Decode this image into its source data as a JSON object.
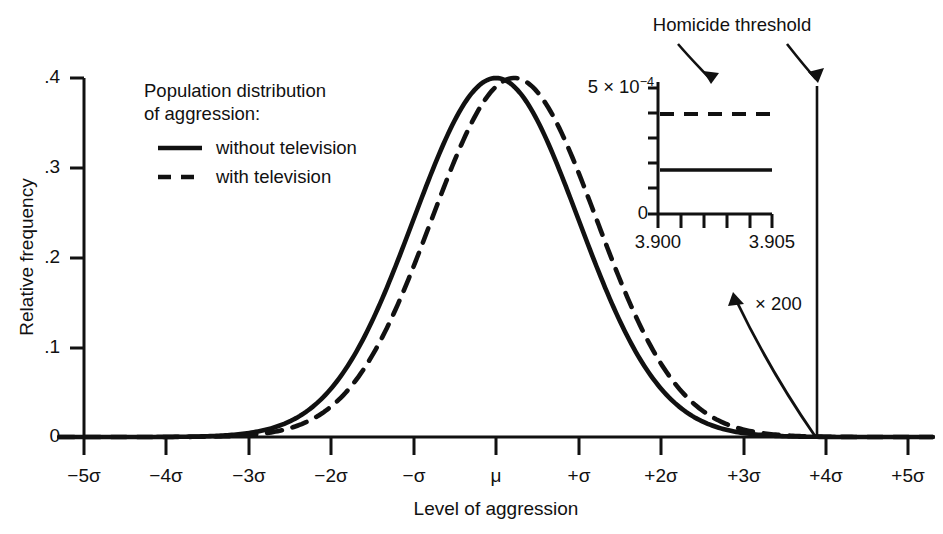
{
  "figure": {
    "background_color": "#ffffff",
    "ink_color": "#111111"
  },
  "axes": {
    "y_title": "Relative frequency",
    "x_title": "Level of aggression",
    "y_ticklabels": [
      ".4",
      ".3",
      ".2",
      ".1",
      "0"
    ],
    "x_ticklabels": [
      "−5σ",
      "−4σ",
      "−3σ",
      "−2σ",
      "−σ",
      "μ",
      "+σ",
      "+2σ",
      "+3σ",
      "+4σ",
      "+5σ"
    ]
  },
  "legend": {
    "title_line1": "Population distribution",
    "title_line2": "of aggression:",
    "items": [
      {
        "label": "without television",
        "style": "solid"
      },
      {
        "label": "with television",
        "style": "dashed"
      }
    ]
  },
  "annotations": {
    "threshold_label": "Homicide threshold",
    "magnification_label": "× 200"
  },
  "inset": {
    "y_top_label_mantissa": "5 × 10",
    "y_top_label_exponent": "−4",
    "y_bottom_label": "0",
    "x_labels": [
      "3.900",
      "3.905"
    ],
    "series": [
      {
        "label": "without television",
        "style": "solid",
        "value": 2.0
      },
      {
        "label": "with television",
        "style": "dashed",
        "value": 4.0
      }
    ]
  },
  "chart_data": {
    "type": "line",
    "title": "",
    "xlabel": "Level of aggression",
    "ylabel": "Relative frequency",
    "xlim": [
      -5,
      5
    ],
    "ylim": [
      0,
      0.4
    ],
    "x_unit": "sigma",
    "x_ticks": [
      -5,
      -4,
      -3,
      -2,
      -1,
      0,
      1,
      2,
      3,
      4,
      5
    ],
    "x_ticklabels": [
      "−5σ",
      "−4σ",
      "−3σ",
      "−2σ",
      "−σ",
      "μ",
      "+σ",
      "+2σ",
      "+3σ",
      "+4σ",
      "+5σ"
    ],
    "y_ticks": [
      0,
      0.1,
      0.2,
      0.3,
      0.4
    ],
    "y_ticklabels": [
      "0",
      ".1",
      ".2",
      ".3",
      ".4"
    ],
    "grid": false,
    "legend_position": "upper-left-inside",
    "series": [
      {
        "name": "without television",
        "style": "solid",
        "distribution": "normal",
        "mean": 0.0,
        "sd": 1.0,
        "peak_value": 0.4,
        "x": [
          -5,
          -4.5,
          -4,
          -3.5,
          -3,
          -2.5,
          -2,
          -1.5,
          -1,
          -0.5,
          0,
          0.5,
          1,
          1.5,
          2,
          2.5,
          3,
          3.5,
          4,
          4.5,
          5
        ],
        "y": [
          0.0,
          0.0,
          0.0001,
          0.0009,
          0.0044,
          0.0175,
          0.054,
          0.1295,
          0.242,
          0.3521,
          0.3989,
          0.3521,
          0.242,
          0.1295,
          0.054,
          0.0175,
          0.0044,
          0.0009,
          0.0001,
          0.0,
          0.0
        ]
      },
      {
        "name": "with television",
        "style": "dashed",
        "distribution": "normal",
        "mean": 0.22,
        "sd": 1.0,
        "peak_value": 0.4,
        "x": [
          -5,
          -4.5,
          -4,
          -3.5,
          -3,
          -2.5,
          -2,
          -1.5,
          -1,
          -0.5,
          0,
          0.5,
          1,
          1.5,
          2,
          2.5,
          3,
          3.5,
          4,
          4.5,
          5
        ],
        "y": [
          0.0,
          0.0,
          0.0,
          0.0004,
          0.0022,
          0.0099,
          0.0347,
          0.0948,
          0.2023,
          0.3361,
          0.3893,
          0.3789,
          0.2897,
          0.1736,
          0.0814,
          0.0298,
          0.0085,
          0.0019,
          0.0003,
          0.0,
          0.0
        ]
      }
    ],
    "annotations": [
      {
        "text": "Homicide threshold",
        "type": "vline-label",
        "x": 3.9
      },
      {
        "text": "× 200",
        "type": "magnification",
        "factor": 200
      }
    ],
    "vlines": [
      {
        "x": 3.9,
        "label": "Homicide threshold"
      }
    ],
    "inset": {
      "type": "line",
      "xlim": [
        3.8995,
        3.9055
      ],
      "ylim": [
        0,
        0.0005
      ],
      "xlabel": "",
      "ylabel": "",
      "x_ticklabels": [
        "3.900",
        "3.905"
      ],
      "y_ticklabels": [
        "0",
        "5 × 10−4"
      ],
      "series": [
        {
          "name": "without television",
          "style": "solid",
          "value": 0.0002
        },
        {
          "name": "with television",
          "style": "dashed",
          "value": 0.0004
        }
      ]
    }
  }
}
